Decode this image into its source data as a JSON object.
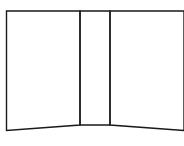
{
  "diagram": {
    "stroke_color": "#1a1a1a",
    "background": "#ffffff",
    "panels": [
      {
        "name": "left-panel",
        "points": "6.5,11 80,11 80,125 6.5,130.5"
      },
      {
        "name": "center-panel",
        "points": "80,11 110,11 110,125 80,125"
      },
      {
        "name": "right-panel",
        "points": "110,11 184,11 184,130.5 110,125"
      }
    ]
  }
}
